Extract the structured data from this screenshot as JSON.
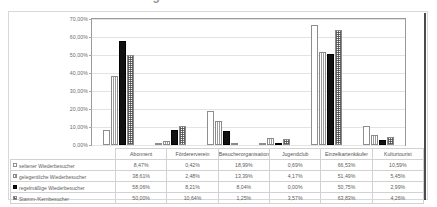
{
  "title": "Besucherbindung",
  "chart_data": {
    "type": "bar",
    "title": "Besucherbindung",
    "xlabel": "",
    "ylabel": "",
    "ylim": [
      0,
      70
    ],
    "ytick_labels": [
      "70,00%",
      "60,00%",
      "50,00%",
      "40,00%",
      "30,00%",
      "20,00%",
      "10,00%",
      "0,00%"
    ],
    "ytick_values": [
      70,
      60,
      50,
      40,
      30,
      20,
      10,
      0
    ],
    "grid": true,
    "legend_position": "table-below",
    "categories": [
      "Abonnent",
      "Fördererverein",
      "Besucherorganisation",
      "Jugendclub",
      "Einzelkartenkäufer",
      "Kulturtourist"
    ],
    "series": [
      {
        "name": "seltener Wiederbesucher",
        "pattern": "open-white",
        "values": [
          8.47,
          0.42,
          18.99,
          0.69,
          66.53,
          10.59
        ],
        "labels": [
          "8,47%",
          "0,42%",
          "18,99%",
          "0,69%",
          "66,53%",
          "10,59%"
        ]
      },
      {
        "name": "gelegentliche Wiederbesucher",
        "pattern": "vertical-stripes",
        "values": [
          38.61,
          2.48,
          13.39,
          4.17,
          51.49,
          5.45
        ],
        "labels": [
          "38,61%",
          "2,48%",
          "13,39%",
          "4,17%",
          "51,49%",
          "5,45%"
        ]
      },
      {
        "name": "regelmäßige Wiederbesucher",
        "pattern": "solid-black",
        "values": [
          58.06,
          8.21,
          8.04,
          0.0,
          50.75,
          2.99
        ],
        "labels": [
          "58,06%",
          "8,21%",
          "8,04%",
          "0,00%",
          "50,75%",
          "2,99%"
        ]
      },
      {
        "name": "Stamm-/Kernbesucher",
        "pattern": "dotted",
        "values": [
          50.0,
          10.64,
          1.25,
          3.57,
          63.83,
          4.26
        ],
        "labels": [
          "50,00%",
          "10,64%",
          "1,25%",
          "3,57%",
          "63,83%",
          "4,26%"
        ]
      }
    ]
  }
}
